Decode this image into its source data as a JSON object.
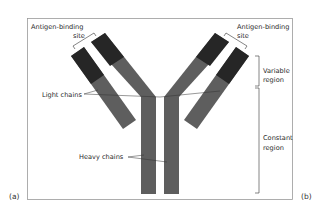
{
  "diagram": {
    "labels": {
      "antigen_site_left_line1": "Antigen-binding",
      "antigen_site_left_line2": "site",
      "antigen_site_right_line1": "Antigen-binding",
      "antigen_site_right_line2": "site",
      "light_chains": "Light chains",
      "heavy_chains": "Heavy chains",
      "variable_region_line1": "Variable",
      "variable_region_line2": "region",
      "constant_region_line1": "Constant",
      "constant_region_line2": "region"
    },
    "panels": {
      "left": "(a)",
      "right": "(b)"
    },
    "colors": {
      "variable_region": "#262626",
      "constant_region": "#5e5e5e",
      "frame": "#9a9a9a",
      "label_text": "#2a2a2a",
      "background": "#ffffff"
    }
  }
}
